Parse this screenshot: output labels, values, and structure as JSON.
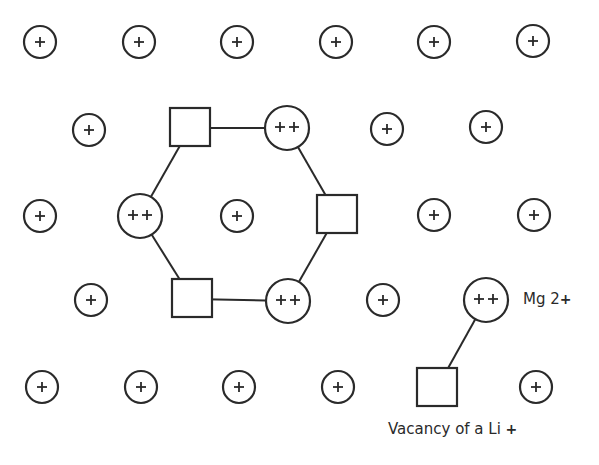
{
  "diagram": {
    "colors": {
      "stroke": "#2a2a2a",
      "background": "#ffffff"
    },
    "li_ion": {
      "symbol": "+",
      "radius": 16
    },
    "mg_ion": {
      "symbol": "++",
      "radius": 22
    },
    "vacancy": {
      "size": 40
    },
    "li_ions": [
      {
        "x": 40,
        "y": 42
      },
      {
        "x": 139,
        "y": 42
      },
      {
        "x": 237,
        "y": 42
      },
      {
        "x": 336,
        "y": 42
      },
      {
        "x": 434,
        "y": 42
      },
      {
        "x": 533,
        "y": 41
      },
      {
        "x": 89,
        "y": 130
      },
      {
        "x": 387,
        "y": 129
      },
      {
        "x": 486,
        "y": 127
      },
      {
        "x": 40,
        "y": 216
      },
      {
        "x": 237,
        "y": 216
      },
      {
        "x": 434,
        "y": 215
      },
      {
        "x": 534,
        "y": 215
      },
      {
        "x": 91,
        "y": 300
      },
      {
        "x": 383,
        "y": 300
      },
      {
        "x": 42,
        "y": 387
      },
      {
        "x": 141,
        "y": 387
      },
      {
        "x": 239,
        "y": 387
      },
      {
        "x": 338,
        "y": 387
      },
      {
        "x": 536,
        "y": 387
      }
    ],
    "mg_ions": [
      {
        "id": "hex-top-right",
        "x": 287,
        "y": 128
      },
      {
        "id": "hex-left",
        "x": 140,
        "y": 216
      },
      {
        "id": "hex-bottom-right",
        "x": 288,
        "y": 301
      },
      {
        "id": "legend-mg",
        "x": 486,
        "y": 300
      }
    ],
    "vacancies": [
      {
        "id": "hex-top-left",
        "x": 190,
        "y": 128
      },
      {
        "id": "hex-right",
        "x": 337,
        "y": 215
      },
      {
        "id": "hex-bottom-left",
        "x": 192,
        "y": 299
      },
      {
        "id": "legend-vacancy",
        "x": 437,
        "y": 388
      }
    ],
    "bonds": [
      {
        "from": "hex-top-left",
        "to": "hex-top-right"
      },
      {
        "from": "hex-top-right",
        "to": "hex-right"
      },
      {
        "from": "hex-right",
        "to": "hex-bottom-right"
      },
      {
        "from": "hex-bottom-right",
        "to": "hex-bottom-left"
      },
      {
        "from": "hex-bottom-left",
        "to": "hex-left"
      },
      {
        "from": "hex-left",
        "to": "hex-top-left"
      },
      {
        "from": "legend-mg",
        "to": "legend-vacancy"
      }
    ]
  },
  "legend": {
    "mg_label": "Mg 2",
    "mg_charge": "+",
    "vacancy_label": "Vacancy of a Li ",
    "vacancy_charge": "+"
  }
}
